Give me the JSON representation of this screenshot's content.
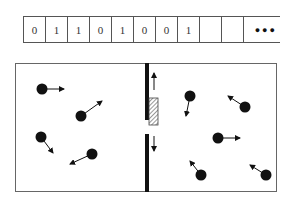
{
  "tape": {
    "cells": [
      "0",
      "1",
      "1",
      "0",
      "1",
      "0",
      "0",
      "1",
      "",
      ""
    ],
    "continuation": "●●●"
  },
  "box": {
    "x": 15,
    "y": 63,
    "w": 261,
    "h": 128
  },
  "wall": {
    "x": 147,
    "top_segment": [
      63,
      120
    ],
    "bottom_segment": [
      134,
      191
    ]
  },
  "door": {
    "x": 148,
    "y": 98,
    "w": 9,
    "h": 27,
    "arrows": [
      "up",
      "down"
    ]
  },
  "molecules": {
    "left_chamber": [
      {
        "cx": 42,
        "cy": 89,
        "dx": 64,
        "dy": 89
      },
      {
        "cx": 81,
        "cy": 116,
        "dx": 102,
        "dy": 101
      },
      {
        "cx": 41,
        "cy": 137,
        "dx": 53,
        "dy": 153
      },
      {
        "cx": 92,
        "cy": 154,
        "dx": 70,
        "dy": 164
      }
    ],
    "right_chamber": [
      {
        "cx": 190,
        "cy": 96,
        "dx": 186,
        "dy": 116
      },
      {
        "cx": 245,
        "cy": 107,
        "dx": 228,
        "dy": 96
      },
      {
        "cx": 218,
        "cy": 138,
        "dx": 240,
        "dy": 138
      },
      {
        "cx": 201,
        "cy": 175,
        "dx": 190,
        "dy": 161
      },
      {
        "cx": 266,
        "cy": 175,
        "dx": 250,
        "dy": 165
      }
    ]
  }
}
